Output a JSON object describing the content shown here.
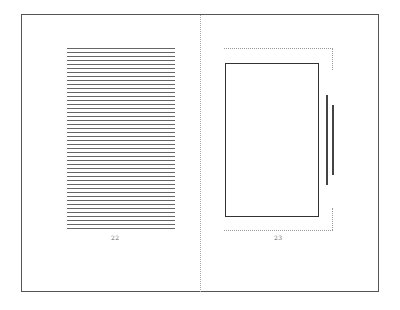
{
  "spread": {
    "left_page": {
      "page_number": "22",
      "text_line_count": 46
    },
    "right_page": {
      "page_number": "23"
    }
  }
}
